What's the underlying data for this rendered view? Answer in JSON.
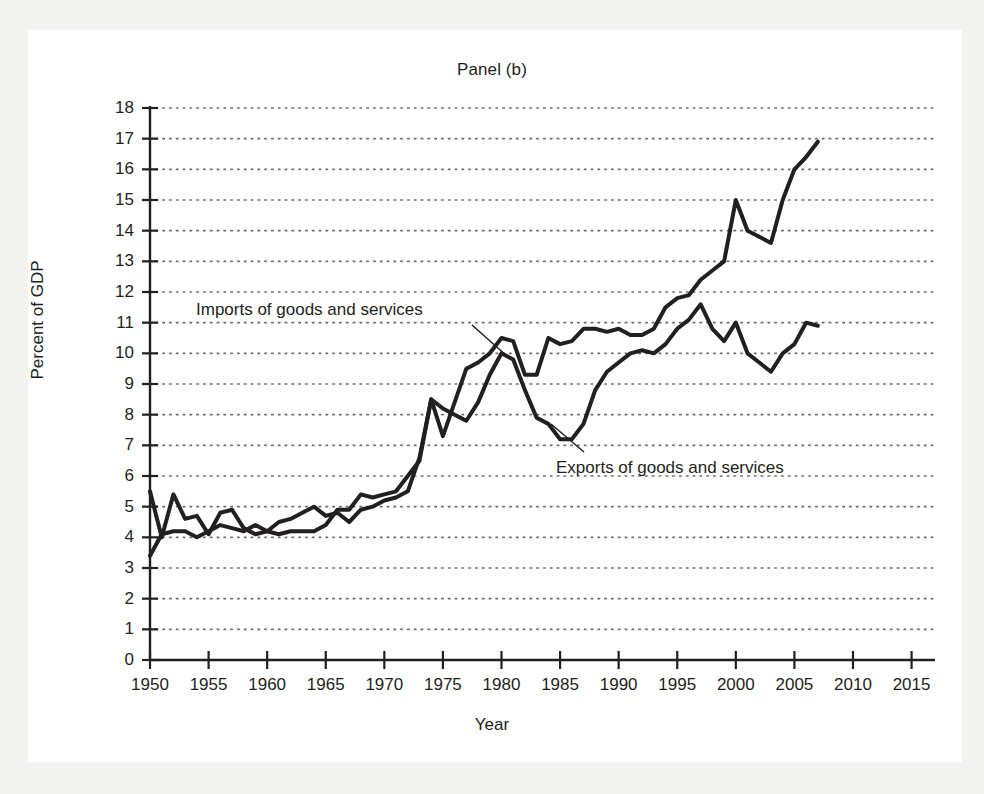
{
  "figure": {
    "title": "Panel (b)",
    "page_background": "#ffffff",
    "outer_background": "#f2f2f0",
    "line_color": "#231f20",
    "grid_color": "#6d6d6d"
  },
  "axes": {
    "ylabel": "Percent of GDP",
    "xlabel": "Year",
    "y_ticks": [
      "0",
      "1",
      "2",
      "3",
      "4",
      "5",
      "6",
      "7",
      "8",
      "9",
      "10",
      "11",
      "12",
      "13",
      "14",
      "15",
      "16",
      "17",
      "18"
    ],
    "x_ticks": [
      "1950",
      "1955",
      "1960",
      "1965",
      "1970",
      "1975",
      "1980",
      "1985",
      "1990",
      "1995",
      "2000",
      "2005",
      "2010",
      "2015"
    ]
  },
  "annotations": {
    "imports_label": "Imports of goods and services",
    "exports_label": "Exports of goods and services"
  },
  "chart_data": {
    "type": "line",
    "title": "Panel (b)",
    "xlabel": "Year",
    "ylabel": "Percent of GDP",
    "xlim": [
      1950,
      2017
    ],
    "ylim": [
      0,
      18
    ],
    "grid": true,
    "grid_style": "dotted horizontal",
    "legend": "inline annotations with leader lines",
    "x": [
      1950,
      1951,
      1952,
      1953,
      1954,
      1955,
      1956,
      1957,
      1958,
      1959,
      1960,
      1961,
      1962,
      1963,
      1964,
      1965,
      1966,
      1967,
      1968,
      1969,
      1970,
      1971,
      1972,
      1973,
      1974,
      1975,
      1976,
      1977,
      1978,
      1979,
      1980,
      1981,
      1982,
      1983,
      1984,
      1985,
      1986,
      1987,
      1988,
      1989,
      1990,
      1991,
      1992,
      1993,
      1994,
      1995,
      1996,
      1997,
      1998,
      1999,
      2000,
      2001,
      2002,
      2003,
      2004,
      2005,
      2006,
      2007
    ],
    "series": [
      {
        "name": "Exports of goods and services",
        "values": [
          5.5,
          4.0,
          5.4,
          4.6,
          4.7,
          4.1,
          4.8,
          4.9,
          4.3,
          4.1,
          4.2,
          4.5,
          4.6,
          4.8,
          5.0,
          4.7,
          4.8,
          4.5,
          4.9,
          5.0,
          5.2,
          5.3,
          5.5,
          6.6,
          8.5,
          8.2,
          8.0,
          7.8,
          8.4,
          9.3,
          10.0,
          9.8,
          8.8,
          7.9,
          7.7,
          7.2,
          7.2,
          7.7,
          8.8,
          9.4,
          9.7,
          10.0,
          10.1,
          10.0,
          10.3,
          10.8,
          11.1,
          11.6,
          10.8,
          10.4,
          11.0,
          10.0,
          9.7,
          9.4,
          10.0,
          10.3,
          11.0,
          10.9
        ],
        "marker": "none",
        "linewidth": 4
      },
      {
        "name": "Imports of goods and services",
        "values": [
          3.4,
          4.1,
          4.2,
          4.2,
          4.0,
          4.2,
          4.4,
          4.3,
          4.2,
          4.4,
          4.2,
          4.1,
          4.2,
          4.2,
          4.2,
          4.4,
          4.9,
          4.9,
          5.4,
          5.3,
          5.4,
          5.5,
          6.0,
          6.5,
          8.5,
          7.3,
          8.4,
          9.5,
          9.7,
          10.0,
          10.5,
          10.4,
          9.3,
          9.3,
          10.5,
          10.3,
          10.4,
          10.8,
          10.8,
          10.7,
          10.8,
          10.6,
          10.6,
          10.8,
          11.5,
          11.8,
          11.9,
          12.4,
          12.7,
          13.0,
          15.0,
          14.0,
          13.8,
          13.6,
          15.0,
          16.0,
          16.4,
          16.9
        ],
        "marker": "none",
        "linewidth": 4
      }
    ]
  }
}
